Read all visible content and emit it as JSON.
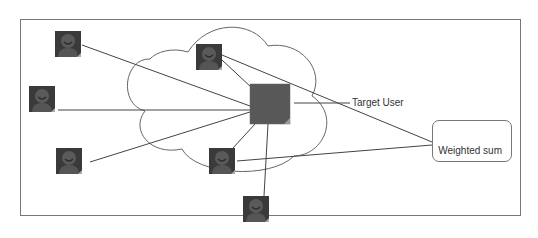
{
  "diagram": {
    "type": "collaborative-filtering-network",
    "frame": {
      "x": 20,
      "y": 19,
      "w": 501,
      "h": 197,
      "stroke": "#777777"
    },
    "cloud": {
      "label": "",
      "stroke": "#666666"
    },
    "target": {
      "label": "Target User",
      "x": 250,
      "y": 84,
      "size": 40,
      "color": "#585858"
    },
    "output": {
      "label": "Weighted sum",
      "x": 432,
      "y": 120,
      "w": 80,
      "h": 42
    },
    "neighbors": [
      {
        "id": "u1",
        "x": 55,
        "y": 31,
        "inside_cloud": false
      },
      {
        "id": "u2",
        "x": 29,
        "y": 86,
        "inside_cloud": false
      },
      {
        "id": "u3",
        "x": 56,
        "y": 148,
        "inside_cloud": false
      },
      {
        "id": "u4",
        "x": 196,
        "y": 44,
        "inside_cloud": true
      },
      {
        "id": "u5",
        "x": 209,
        "y": 148,
        "inside_cloud": true
      },
      {
        "id": "u6",
        "x": 243,
        "y": 196,
        "inside_cloud": false
      }
    ],
    "colors": {
      "icon_bg": "#3a3a3a",
      "icon_face": "#5a5a5a",
      "line": "#444444",
      "target": "#585858"
    }
  }
}
